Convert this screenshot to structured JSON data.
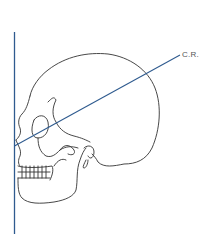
{
  "diagram": {
    "type": "lateral skull radiographic positioning",
    "labels": {
      "central_ray": "C.R."
    },
    "colors": {
      "line": "#2f5b8f",
      "outline": "#333333",
      "label": "#555555"
    }
  }
}
